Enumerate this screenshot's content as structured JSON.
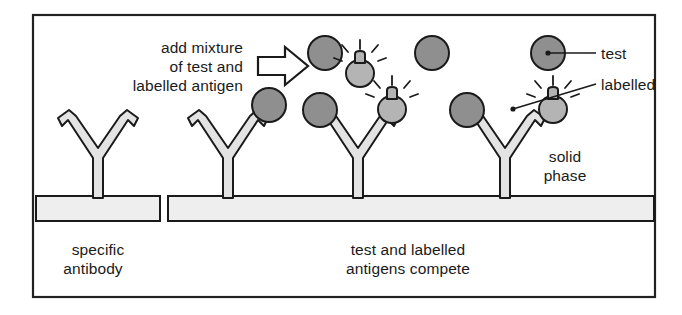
{
  "figure": {
    "frame": {
      "border_color": "#222222",
      "background_color": "#ffffff"
    }
  },
  "colors": {
    "outline": "#1a1a1a",
    "antibody_fill": "#e3e3e3",
    "plate_fill": "#eeeeee",
    "test_antigen_fill": "#8f8f8f",
    "labelled_antigen_fill": "#b4b4b4",
    "text": "#1a1a1a",
    "leader_line": "#1a1a1a"
  },
  "instruction": {
    "name": "add-mixture-instruction",
    "lines": [
      "add mixture",
      "of test and",
      "labelled antigen"
    ]
  },
  "arrow": {
    "name": "process-arrow",
    "direction": "right",
    "style": "hollow-outline"
  },
  "legend": {
    "items": [
      {
        "key": "test",
        "label": "test",
        "swatch": "test-antigen",
        "fill": "#8f8f8f"
      },
      {
        "key": "labelled",
        "label": "labelled",
        "swatch": "labelled-antigen",
        "fill": "#b4b4b4"
      }
    ]
  },
  "solid_phase": {
    "name": "solid-phase-label",
    "lines": [
      "solid",
      "phase"
    ]
  },
  "captions": {
    "left": {
      "name": "specific-antibody-caption",
      "lines": [
        "specific",
        "antibody"
      ]
    },
    "right": {
      "name": "competition-caption",
      "lines": [
        "test and labelled",
        "antigens compete"
      ]
    }
  },
  "panels": [
    {
      "key": "left-panel",
      "label": "specific antibody",
      "antibody_count": 1,
      "plate": {
        "x": 36,
        "y": 196,
        "width": 124,
        "height": 25
      }
    },
    {
      "key": "right-panel",
      "label": "test and labelled antigens compete",
      "antibody_count": 3,
      "plate": {
        "x": 168,
        "y": 196,
        "width": 486,
        "height": 25
      }
    }
  ],
  "antibodies": [
    {
      "name": "antibody-1",
      "x": 98,
      "bound_left": "none",
      "bound_right": "none"
    },
    {
      "name": "antibody-2",
      "x": 228,
      "bound_left": "none",
      "bound_right": "test-antigen"
    },
    {
      "name": "antibody-3",
      "x": 358,
      "bound_left": "test-antigen",
      "bound_right": "labelled-antigen"
    },
    {
      "name": "antibody-4",
      "x": 505,
      "bound_left": "test-antigen",
      "bound_right": "labelled-antigen"
    }
  ],
  "free_antigens": [
    {
      "name": "free-test-antigen-1",
      "type": "test",
      "cx": 325,
      "cy": 53
    },
    {
      "name": "free-labelled-antigen-1",
      "type": "labelled",
      "cx": 360,
      "cy": 72
    },
    {
      "name": "free-labelled-antigen-2",
      "type": "labelled",
      "cx": 392,
      "cy": 97
    },
    {
      "name": "free-test-antigen-2",
      "type": "test",
      "cx": 432,
      "cy": 53
    },
    {
      "name": "free-labelled-antigen-3",
      "type": "labelled",
      "cx": 513,
      "cy": 72
    },
    {
      "name": "free-labelled-antigen-4",
      "type": "labelled",
      "cx": 553,
      "cy": 97
    }
  ],
  "legend_markers": {
    "test_circle": {
      "cx": 548,
      "cy": 53
    },
    "labelled_circle": {
      "cx": 513,
      "cy": 72
    }
  }
}
